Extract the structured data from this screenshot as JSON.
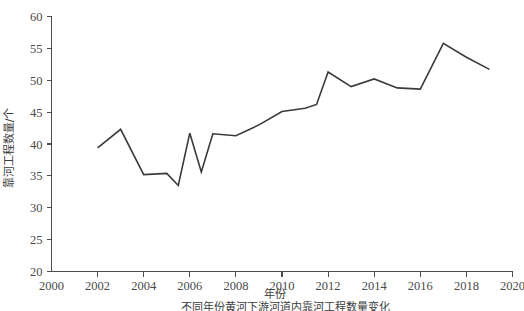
{
  "chart_data": {
    "type": "line",
    "title": "",
    "xlabel": "年份",
    "ylabel": "靠河工程数量/个",
    "xlim": [
      2000,
      2020
    ],
    "ylim": [
      20,
      60
    ],
    "xticks": [
      2000,
      2002,
      2004,
      2006,
      2008,
      2010,
      2012,
      2014,
      2016,
      2018,
      2020
    ],
    "yticks": [
      20,
      25,
      30,
      35,
      40,
      45,
      50,
      55,
      60
    ],
    "grid": false,
    "legend": null,
    "line_color": "#3a3a3a",
    "x": [
      2002,
      2003,
      2004,
      2005,
      2005.5,
      2006,
      2006.5,
      2007,
      2008,
      2009,
      2010,
      2011,
      2011.5,
      2012,
      2013,
      2014,
      2015,
      2016,
      2017,
      2018,
      2019
    ],
    "values": [
      39.4,
      42.3,
      35.2,
      35.4,
      33.5,
      41.7,
      35.6,
      41.6,
      41.3,
      43.0,
      45.1,
      45.6,
      46.2,
      51.3,
      49.0,
      50.2,
      48.8,
      48.6,
      55.8,
      53.6,
      51.7
    ],
    "series": [
      {
        "name": "靠河工程数量",
        "values": [
          39.4,
          42.3,
          35.2,
          35.4,
          33.5,
          41.7,
          35.6,
          41.6,
          41.3,
          43.0,
          45.1,
          45.6,
          46.2,
          51.3,
          49.0,
          50.2,
          48.8,
          48.6,
          55.8,
          53.6,
          51.7
        ]
      }
    ]
  },
  "caption": {
    "text": "不同年份黄河下游河道内靠河工程数量变化"
  },
  "axes": {
    "x_title": "年份",
    "y_title": "靠河工程数量/个",
    "x_tick_labels": [
      "2000",
      "2002",
      "2004",
      "2006",
      "2008",
      "2010",
      "2012",
      "2014",
      "2016",
      "2018",
      "2020"
    ],
    "y_tick_labels": [
      "20",
      "25",
      "30",
      "35",
      "40",
      "45",
      "50",
      "55",
      "60"
    ]
  }
}
